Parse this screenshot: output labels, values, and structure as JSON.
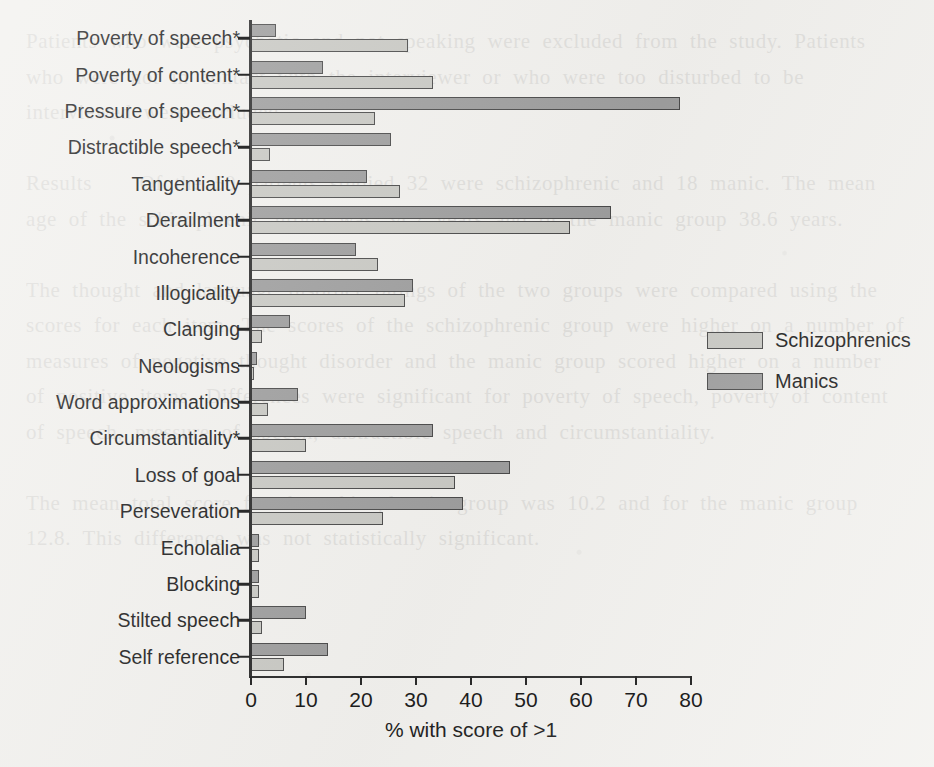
{
  "chart_data": {
    "type": "bar",
    "orientation": "horizontal",
    "title": "",
    "xlabel": "% with score of >1",
    "ylabel": "",
    "xlim": [
      0,
      80
    ],
    "xticks": [
      0,
      10,
      20,
      30,
      40,
      50,
      60,
      70,
      80
    ],
    "grid": false,
    "legend_position": "right",
    "categories": [
      "Poverty of speech*",
      "Poverty of content*",
      "Pressure of speech*",
      "Distractible speech*",
      "Tangentiality",
      "Derailment",
      "Incoherence",
      "Illogicality",
      "Clanging",
      "Neologisms",
      "Word approximations",
      "Circumstantiality*",
      "Loss of goal",
      "Perseveration",
      "Echolalia",
      "Blocking",
      "Stilted speech",
      "Self reference"
    ],
    "series": [
      {
        "name": "Schizophrenics",
        "color": "#c9c9c4",
        "values": [
          28.5,
          33,
          22.5,
          3.5,
          27,
          58,
          23,
          28,
          2,
          0.5,
          3,
          10,
          37,
          24,
          1.5,
          1.5,
          2,
          6
        ]
      },
      {
        "name": "Manics",
        "color": "#9e9e9e",
        "values": [
          4.5,
          13,
          78,
          25.5,
          21,
          65.5,
          19,
          29.5,
          7,
          1,
          8.5,
          33,
          47,
          38.5,
          1.5,
          1.5,
          10,
          14
        ]
      }
    ]
  },
  "legend": {
    "items": [
      {
        "label": "Schizophrenics",
        "swatch": "schiz"
      },
      {
        "label": "Manics",
        "swatch": "manics"
      }
    ]
  },
  "bleed_text": "Patients who were psychotic and not speaking were excluded from the study. Patients who were not in contact with the interviewer or who were too disturbed to be interviewed were excluded.\n\nResults    Of the 50 patients studied 32 were schizophrenic and 18 manic. The mean age of the schizophrenic group was 34.2 years and of the manic group 38.6 years.\n\nThe thought and language disorder ratings of the two groups were compared using the scores for each item. The scores of the schizophrenic group were higher on a number of measures of negative thought disorder and the manic group scored higher on a number of positive items. Differences were significant for poverty of speech, poverty of content of speech, pressure of speech, distractible speech and circumstantiality.\n\nThe mean total score for the schizophrenic group was 10.2 and for the manic group 12.8. This difference was not statistically significant."
}
